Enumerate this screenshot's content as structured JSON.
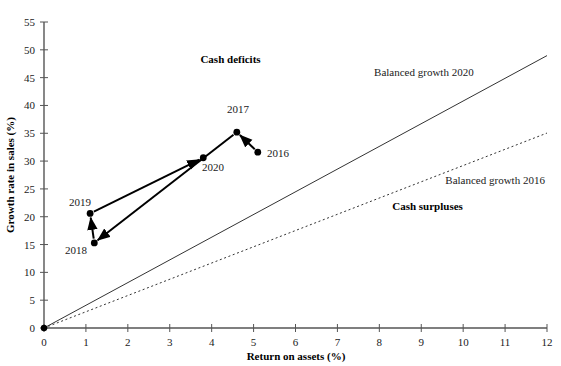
{
  "chart_data": {
    "type": "scatter",
    "title": "",
    "xlabel": "Return on assets (%)",
    "ylabel": "Growth rate in sales (%)",
    "xlim": [
      0,
      12
    ],
    "ylim": [
      0,
      55
    ],
    "xticks": [
      "0",
      "1",
      "2",
      "3",
      "4",
      "5",
      "6",
      "7",
      "8",
      "9",
      "10",
      "11",
      "12"
    ],
    "yticks": [
      "0",
      "5",
      "10",
      "15",
      "20",
      "25",
      "30",
      "35",
      "40",
      "45",
      "50",
      "55"
    ],
    "grid": false,
    "legend_position": "inline-annotations",
    "series": [
      {
        "name": "Company trajectory",
        "style": "connected-arrows",
        "points": [
          {
            "label": "2016",
            "x": 5.1,
            "y": 31.6
          },
          {
            "label": "2017",
            "x": 4.6,
            "y": 35.2
          },
          {
            "label": "2018",
            "x": 1.2,
            "y": 15.3
          },
          {
            "label": "2019",
            "x": 1.1,
            "y": 20.6
          },
          {
            "label": "2020",
            "x": 3.8,
            "y": 30.6
          }
        ],
        "arrow_order": [
          "2016",
          "2017",
          "2018",
          "2019",
          "2020"
        ]
      }
    ],
    "reference_lines": [
      {
        "name": "Balanced growth 2020",
        "style": "solid",
        "slope": 4.08,
        "intercept": 0,
        "label": "Balanced growth 2020"
      },
      {
        "name": "Balanced growth 2016",
        "style": "dotted",
        "slope": 2.92,
        "intercept": 0,
        "label": "Balanced growth 2016"
      }
    ],
    "annotations": [
      {
        "name": "cash-deficits",
        "text": "Cash deficits",
        "x": 4.45,
        "y": 47.6
      },
      {
        "name": "cash-surpluses",
        "text": "Cash surpluses",
        "x": 9.15,
        "y": 21.2
      },
      {
        "name": "balanced-growth-2020-label",
        "text": "Balanced growth 2020",
        "x": 10.25,
        "y": 45.3
      },
      {
        "name": "balanced-growth-2016-label",
        "text": "Balanced growth 2016",
        "x": 11.95,
        "y": 25.9
      }
    ],
    "point_labels": [
      {
        "name": "label-2016",
        "text": "2016",
        "x": 278,
        "y": 157
      },
      {
        "name": "label-2017",
        "text": "2017",
        "x": 238,
        "y": 113
      },
      {
        "name": "label-2018",
        "text": "2018",
        "x": 76,
        "y": 254
      },
      {
        "name": "label-2019",
        "text": "2019",
        "x": 80,
        "y": 206
      },
      {
        "name": "label-2020",
        "text": "2020",
        "x": 213,
        "y": 171
      }
    ],
    "colors": {
      "axis": "#555555",
      "series": "#000000",
      "reference_line": "#333333",
      "text": "#111111",
      "background": "#ffffff"
    }
  }
}
